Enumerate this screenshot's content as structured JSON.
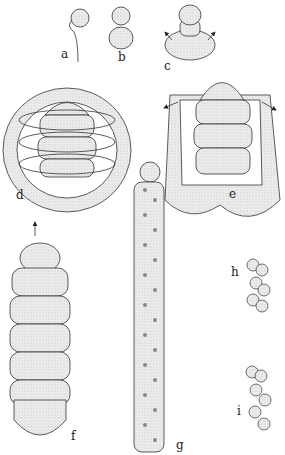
{
  "figure": {
    "panels": [
      {
        "id": "a",
        "label": "a"
      },
      {
        "id": "b",
        "label": "b"
      },
      {
        "id": "c",
        "label": "c"
      },
      {
        "id": "d",
        "label": "d"
      },
      {
        "id": "e",
        "label": "e"
      },
      {
        "id": "f",
        "label": "f"
      },
      {
        "id": "g",
        "label": "g"
      },
      {
        "id": "h",
        "label": "h"
      },
      {
        "id": "i",
        "label": "i"
      }
    ],
    "colors": {
      "fill": "#e6e6e6",
      "stroke": "#333333",
      "dots": "#777777",
      "background": "#ffffff"
    }
  }
}
